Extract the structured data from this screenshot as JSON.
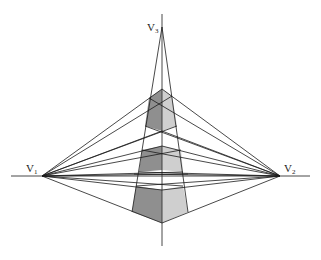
{
  "figure": {
    "type": "three-point perspective construction",
    "vanishing_points": [
      {
        "id": "V1",
        "label": "V",
        "subscript": "1",
        "x": 42,
        "y": 176
      },
      {
        "id": "V2",
        "label": "V",
        "subscript": "2",
        "x": 280,
        "y": 176
      },
      {
        "id": "V3",
        "label": "V",
        "subscript": "3",
        "x": 162,
        "y": 27
      }
    ],
    "horizon_line": {
      "y": 176,
      "x1": 11,
      "x2": 310
    },
    "vertical_axis": {
      "x": 162,
      "y1": 14,
      "y2": 246
    },
    "colors": {
      "left_face": "#8f8f8f",
      "right_face": "#cfcfcf",
      "line": "#1a1a1a",
      "background": "#ffffff"
    }
  }
}
